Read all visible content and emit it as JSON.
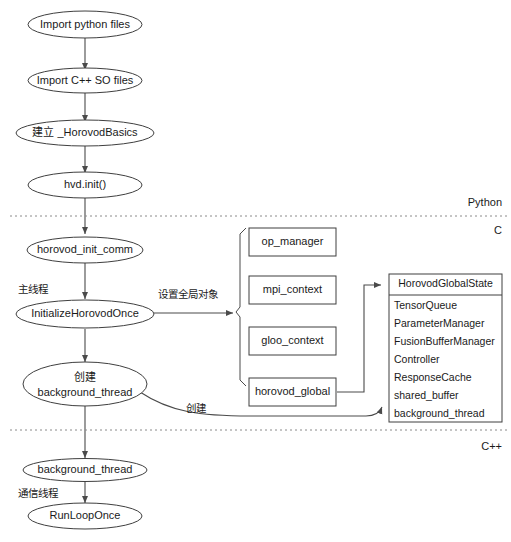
{
  "diagram": {
    "zones": [
      {
        "id": "python",
        "label": "Python"
      },
      {
        "id": "c",
        "label": "C"
      },
      {
        "id": "cpp",
        "label": "C++"
      }
    ],
    "flow_nodes": [
      {
        "id": "import-python-files",
        "label": "Import python files"
      },
      {
        "id": "import-cpp-so-files",
        "label": "Import C++ SO files"
      },
      {
        "id": "create-horovodbasics",
        "label": "建立 _HorovodBasics"
      },
      {
        "id": "hvd-init",
        "label": "hvd.init()"
      },
      {
        "id": "horovod-init-comm",
        "label": "horovod_init_comm"
      },
      {
        "id": "initialize-horovod-once",
        "label": "InitializeHorovodOnce"
      },
      {
        "id": "create-background-thread",
        "label_line1": "创建",
        "label_line2": "background_thread"
      },
      {
        "id": "background-thread",
        "label": "background_thread"
      },
      {
        "id": "run-loop-once",
        "label": "RunLoopOnce"
      }
    ],
    "object_boxes": [
      {
        "id": "op-manager",
        "label": "op_manager"
      },
      {
        "id": "mpi-context",
        "label": "mpi_context"
      },
      {
        "id": "gloo-context",
        "label": "gloo_context"
      },
      {
        "id": "horovod-global",
        "label": "horovod_global"
      }
    ],
    "global_state": {
      "title": "HorovodGlobalState",
      "fields": [
        "TensorQueue",
        "ParameterManager",
        "FusionBufferManager",
        "Controller",
        "ResponseCache",
        "shared_buffer",
        "background_thread"
      ]
    },
    "annotations": [
      {
        "id": "main-thread",
        "label": "主线程"
      },
      {
        "id": "set-global-object",
        "label": "设置全局对象"
      },
      {
        "id": "create-edge-label",
        "label": "创建"
      },
      {
        "id": "comm-thread",
        "label": "通信线程"
      }
    ],
    "colors": {
      "stroke": "#3f3f3f",
      "edge": "#4a4a4a",
      "divider": "#8a8a8a",
      "text": "#1a1a1a",
      "background": "#ffffff"
    }
  }
}
